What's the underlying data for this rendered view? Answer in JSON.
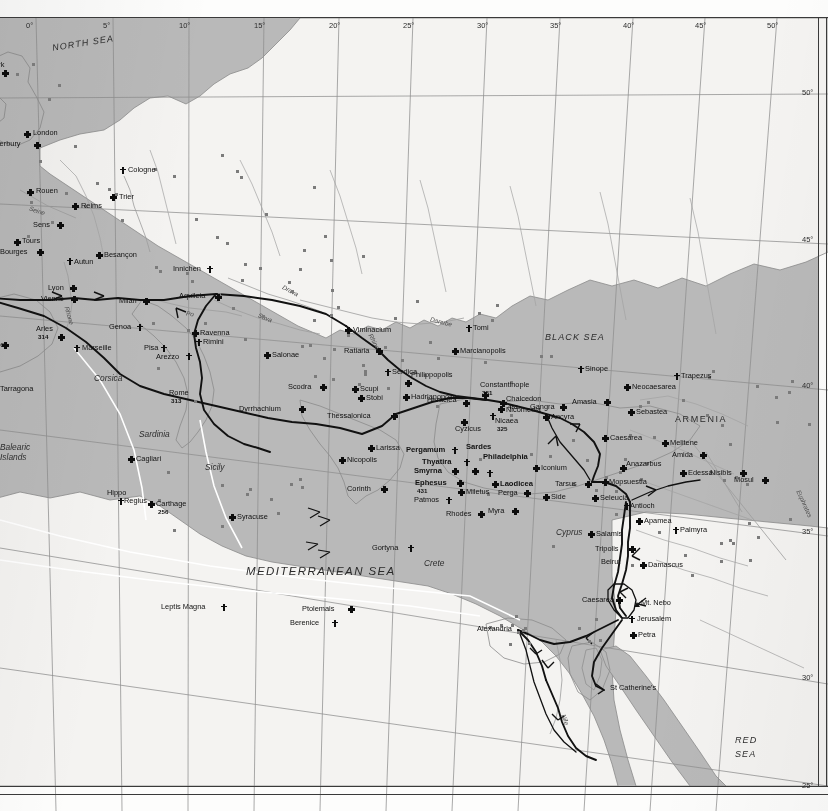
{
  "map": {
    "title": "Christian Centres and Pilgrim Routes of the Late Roman and Early Byzantine World",
    "projection_note": "conic graticule, 5-degree interval",
    "colors": {
      "sea": "#b9b9b9",
      "land": "#f4f3f1",
      "land_shaded": "#e7e6e3",
      "route": "#111111",
      "sea_route": "#ffffff",
      "graticule": "#8e8e8e",
      "text": "#111111"
    }
  },
  "graticule": {
    "longitude_labels": [
      "0°",
      "5°",
      "10°",
      "15°",
      "20°",
      "25°",
      "30°",
      "35°",
      "40°",
      "45°",
      "50°"
    ],
    "latitude_labels": [
      "50°",
      "45°",
      "40°",
      "35°",
      "30°",
      "25°"
    ]
  },
  "seas": [
    {
      "name": "NORTH SEA",
      "x": 52,
      "y": 38,
      "rot": -9,
      "size": "sm"
    },
    {
      "name": "BLACK SEA",
      "x": 545,
      "y": 332,
      "rot": 0,
      "size": "sm"
    },
    {
      "name": "MEDITERRANEAN SEA",
      "x": 246,
      "y": 565,
      "rot": 0,
      "size": "lg"
    },
    {
      "name": "RED",
      "x": 735,
      "y": 735,
      "rot": 0,
      "size": "sm"
    },
    {
      "name": "SEA",
      "x": 735,
      "y": 749,
      "rot": 0,
      "size": "sm"
    }
  ],
  "regions": [
    {
      "name": "ARMENIA",
      "x": 675,
      "y": 414
    }
  ],
  "islands": [
    {
      "name": "Corsica",
      "x": 94,
      "y": 373
    },
    {
      "name": "Sardinia",
      "x": 139,
      "y": 429
    },
    {
      "name": "Sicily",
      "x": 205,
      "y": 462
    },
    {
      "name": "Balearic",
      "x": 0,
      "y": 442
    },
    {
      "name": "Islands",
      "x": 0,
      "y": 452
    },
    {
      "name": "Crete",
      "x": 424,
      "y": 558
    },
    {
      "name": "Cyprus",
      "x": 556,
      "y": 527
    }
  ],
  "rivers": [
    {
      "name": "Rhine",
      "x": 366,
      "y": 338,
      "rot": 62
    },
    {
      "name": "Rhone",
      "x": 60,
      "y": 312,
      "rot": 74
    },
    {
      "name": "Seine",
      "x": 29,
      "y": 207,
      "rot": 18
    },
    {
      "name": "Danube",
      "x": 430,
      "y": 318,
      "rot": 14
    },
    {
      "name": "Drava",
      "x": 282,
      "y": 287,
      "rot": 28
    },
    {
      "name": "Sava",
      "x": 258,
      "y": 314,
      "rot": 22
    },
    {
      "name": "Po",
      "x": 186,
      "y": 310,
      "rot": 8
    },
    {
      "name": "Nile",
      "x": 560,
      "y": 716,
      "rot": 70
    },
    {
      "name": "Euphrates",
      "x": 790,
      "y": 500,
      "rot": 66
    }
  ],
  "places": [
    {
      "name": "York",
      "x": 2,
      "y": 70,
      "marker": "xcross",
      "lx": -12,
      "ly": -9,
      "anchor": "right"
    },
    {
      "name": "London",
      "x": 24,
      "y": 131,
      "marker": "xcross",
      "lx": 9,
      "ly": -2,
      "anchor": "left"
    },
    {
      "name": "Canterbury",
      "x": 34,
      "y": 142,
      "marker": "xcross",
      "lx": -50,
      "ly": -2,
      "anchor": "left"
    },
    {
      "name": "Cologne",
      "x": 120,
      "y": 167,
      "marker": "pcross",
      "lx": 8,
      "ly": -1,
      "anchor": "left"
    },
    {
      "name": "Rouen",
      "x": 27,
      "y": 189,
      "marker": "xcross",
      "lx": 9,
      "ly": -2,
      "anchor": "left"
    },
    {
      "name": "Trier",
      "x": 110,
      "y": 194,
      "marker": "xcross",
      "lx": 9,
      "ly": -1,
      "anchor": "left"
    },
    {
      "name": "Reims",
      "x": 72,
      "y": 203,
      "marker": "xcross",
      "lx": 9,
      "ly": -1,
      "anchor": "left"
    },
    {
      "name": "Sens",
      "x": 57,
      "y": 222,
      "marker": "xcross",
      "lx": -24,
      "ly": -1,
      "anchor": "left"
    },
    {
      "name": "Tours",
      "x": 14,
      "y": 239,
      "marker": "xcross",
      "lx": 8,
      "ly": -2,
      "anchor": "left"
    },
    {
      "name": "Bourges",
      "x": 37,
      "y": 249,
      "marker": "xcross",
      "lx": -37,
      "ly": -1,
      "anchor": "left"
    },
    {
      "name": "Autun",
      "x": 67,
      "y": 258,
      "marker": "pcross",
      "lx": 7,
      "ly": 0,
      "anchor": "left"
    },
    {
      "name": "Besançon",
      "x": 96,
      "y": 252,
      "marker": "xcross",
      "lx": 8,
      "ly": -1,
      "anchor": "left"
    },
    {
      "name": "Innichen",
      "x": 207,
      "y": 266,
      "marker": "pcross",
      "lx": -34,
      "ly": -1,
      "anchor": "left"
    },
    {
      "name": "Lyon",
      "x": 70,
      "y": 285,
      "marker": "xcross",
      "lx": -22,
      "ly": -1,
      "anchor": "left"
    },
    {
      "name": "Vienne",
      "x": 71,
      "y": 296,
      "marker": "xcross",
      "lx": -30,
      "ly": -1,
      "anchor": "left"
    },
    {
      "name": "Milan",
      "x": 143,
      "y": 298,
      "marker": "xcross",
      "lx": -24,
      "ly": -1,
      "anchor": "left"
    },
    {
      "name": "Aquileia",
      "x": 215,
      "y": 294,
      "marker": "xcross",
      "lx": -36,
      "ly": -2,
      "anchor": "left"
    },
    {
      "name": "Genoa",
      "x": 137,
      "y": 324,
      "marker": "pcross",
      "lx": -28,
      "ly": -1,
      "anchor": "left"
    },
    {
      "name": "Ravenna",
      "x": 192,
      "y": 330,
      "marker": "xcross",
      "lx": 8,
      "ly": -1,
      "anchor": "left"
    },
    {
      "name": "Rimini",
      "x": 196,
      "y": 339,
      "marker": "pcross",
      "lx": 7,
      "ly": -1,
      "anchor": "left"
    },
    {
      "name": "Arles",
      "x": 58,
      "y": 334,
      "marker": "xcross",
      "lx": -22,
      "ly": -9,
      "anchor": "left",
      "date": "314"
    },
    {
      "name": "Narbonne",
      "x": 2,
      "y": 342,
      "marker": "xcross",
      "lx": -30,
      "ly": -1,
      "anchor": "left"
    },
    {
      "name": "Marseille",
      "x": 74,
      "y": 345,
      "marker": "pcross",
      "lx": 8,
      "ly": -1,
      "anchor": "left"
    },
    {
      "name": "Pisa",
      "x": 161,
      "y": 345,
      "marker": "pcross",
      "lx": -17,
      "ly": -1,
      "anchor": "left"
    },
    {
      "name": "Arezzo",
      "x": 186,
      "y": 353,
      "marker": "pcross",
      "lx": -30,
      "ly": 0,
      "anchor": "left"
    },
    {
      "name": "Salonae",
      "x": 264,
      "y": 352,
      "marker": "xcross",
      "lx": 8,
      "ly": -1,
      "anchor": "left"
    },
    {
      "name": "Tarragona",
      "x": 0,
      "y": 389,
      "marker": "none",
      "lx": 0,
      "ly": -4,
      "anchor": "left"
    },
    {
      "name": "Rome",
      "x": 192,
      "y": 398,
      "marker": "town",
      "lx": -23,
      "ly": -9,
      "anchor": "left",
      "date": "313"
    },
    {
      "name": "Dyrrhachium",
      "x": 299,
      "y": 406,
      "marker": "xcross",
      "lx": -60,
      "ly": -1,
      "anchor": "left"
    },
    {
      "name": "Scodra",
      "x": 320,
      "y": 384,
      "marker": "xcross",
      "lx": -32,
      "ly": -1,
      "anchor": "left"
    },
    {
      "name": "Stobi",
      "x": 358,
      "y": 395,
      "marker": "xcross",
      "lx": 8,
      "ly": -1,
      "anchor": "left"
    },
    {
      "name": "Scupi",
      "x": 352,
      "y": 386,
      "marker": "xcross",
      "lx": 8,
      "ly": -1,
      "anchor": "left"
    },
    {
      "name": "Viminacium",
      "x": 345,
      "y": 327,
      "marker": "xcross",
      "lx": 8,
      "ly": -1,
      "anchor": "left"
    },
    {
      "name": "Ratiaria",
      "x": 376,
      "y": 348,
      "marker": "xcross",
      "lx": -32,
      "ly": -1,
      "anchor": "left"
    },
    {
      "name": "Serdica",
      "x": 385,
      "y": 369,
      "marker": "pcross",
      "lx": 7,
      "ly": -1,
      "anchor": "left"
    },
    {
      "name": "Philippopolis",
      "x": 405,
      "y": 380,
      "marker": "xcross",
      "lx": 6,
      "ly": -9,
      "anchor": "left"
    },
    {
      "name": "Hadrianopolis",
      "x": 403,
      "y": 394,
      "marker": "xcross",
      "lx": 8,
      "ly": -1,
      "anchor": "left"
    },
    {
      "name": "Tomi",
      "x": 466,
      "y": 325,
      "marker": "pcross",
      "lx": 7,
      "ly": -1,
      "anchor": "left"
    },
    {
      "name": "Marcianopolis",
      "x": 452,
      "y": 348,
      "marker": "xcross",
      "lx": 8,
      "ly": -1,
      "anchor": "left"
    },
    {
      "name": "Heraclea",
      "x": 463,
      "y": 400,
      "marker": "xcross",
      "lx": -36,
      "ly": -4,
      "anchor": "left"
    },
    {
      "name": "Constantinople",
      "x": 482,
      "y": 392,
      "marker": "xcross",
      "lx": -2,
      "ly": -11,
      "anchor": "left",
      "date": "381"
    },
    {
      "name": "Chalcedon",
      "x": 500,
      "y": 400,
      "marker": "xcross",
      "lx": 6,
      "ly": -5,
      "anchor": "left",
      "date": "451"
    },
    {
      "name": "Nicomedia",
      "x": 498,
      "y": 406,
      "marker": "xcross",
      "lx": 8,
      "ly": 0,
      "anchor": "left"
    },
    {
      "name": "Nicaea",
      "x": 490,
      "y": 413,
      "marker": "pcross",
      "lx": 5,
      "ly": 4,
      "anchor": "left",
      "date": "325"
    },
    {
      "name": "Gangra",
      "x": 560,
      "y": 404,
      "marker": "xcross",
      "lx": -30,
      "ly": -1,
      "anchor": "left"
    },
    {
      "name": "Ancyra",
      "x": 543,
      "y": 414,
      "marker": "xcross",
      "lx": 8,
      "ly": -1,
      "anchor": "left"
    },
    {
      "name": "Thessalonica",
      "x": 391,
      "y": 413,
      "marker": "xcross",
      "lx": -64,
      "ly": -1,
      "anchor": "left"
    },
    {
      "name": "Cyzicus",
      "x": 461,
      "y": 419,
      "marker": "xcross",
      "lx": -6,
      "ly": 6,
      "anchor": "left"
    },
    {
      "name": "Larissa",
      "x": 368,
      "y": 445,
      "marker": "xcross",
      "lx": 8,
      "ly": -1,
      "anchor": "left"
    },
    {
      "name": "Nicopolis",
      "x": 339,
      "y": 457,
      "marker": "xcross",
      "lx": 8,
      "ly": -1,
      "anchor": "left"
    },
    {
      "name": "Corinth",
      "x": 381,
      "y": 486,
      "marker": "xcross",
      "lx": -34,
      "ly": -1,
      "anchor": "left"
    },
    {
      "name": "Pergamum",
      "x": 452,
      "y": 447,
      "marker": "pcross",
      "lx": -46,
      "ly": -1,
      "anchor": "left",
      "bold": true
    },
    {
      "name": "Thyatira",
      "x": 464,
      "y": 459,
      "marker": "pcross",
      "lx": -42,
      "ly": -1,
      "anchor": "left",
      "bold": true
    },
    {
      "name": "Sardes",
      "x": 472,
      "y": 468,
      "marker": "xcross",
      "lx": -6,
      "ly": -25,
      "anchor": "left",
      "bold": true
    },
    {
      "name": "Smyrna",
      "x": 452,
      "y": 468,
      "marker": "xcross",
      "lx": -38,
      "ly": -1,
      "anchor": "left",
      "bold": true
    },
    {
      "name": "Philadelphia",
      "x": 487,
      "y": 470,
      "marker": "pcross",
      "lx": -4,
      "ly": -17,
      "anchor": "left",
      "bold": true
    },
    {
      "name": "Ephesus",
      "x": 457,
      "y": 480,
      "marker": "xcross",
      "lx": -42,
      "ly": -1,
      "anchor": "left",
      "bold": true,
      "date": "431"
    },
    {
      "name": "Laodicea",
      "x": 492,
      "y": 481,
      "marker": "xcross",
      "lx": 8,
      "ly": -1,
      "anchor": "left",
      "bold": true
    },
    {
      "name": "Miletus",
      "x": 458,
      "y": 489,
      "marker": "xcross",
      "lx": 8,
      "ly": -1,
      "anchor": "left"
    },
    {
      "name": "Patmos",
      "x": 446,
      "y": 497,
      "marker": "pcross",
      "lx": -32,
      "ly": -1,
      "anchor": "left"
    },
    {
      "name": "Rhodes",
      "x": 478,
      "y": 511,
      "marker": "xcross",
      "lx": -32,
      "ly": -1,
      "anchor": "left"
    },
    {
      "name": "Myra",
      "x": 512,
      "y": 508,
      "marker": "xcross",
      "lx": -24,
      "ly": -1,
      "anchor": "left"
    },
    {
      "name": "Perga",
      "x": 524,
      "y": 490,
      "marker": "xcross",
      "lx": -26,
      "ly": -1,
      "anchor": "left"
    },
    {
      "name": "Side",
      "x": 543,
      "y": 494,
      "marker": "xcross",
      "lx": 8,
      "ly": -1,
      "anchor": "left"
    },
    {
      "name": "Iconium",
      "x": 533,
      "y": 465,
      "marker": "xcross",
      "lx": 8,
      "ly": -1,
      "anchor": "left"
    },
    {
      "name": "Tarsus",
      "x": 585,
      "y": 481,
      "marker": "xcross",
      "lx": -30,
      "ly": -1,
      "anchor": "left"
    },
    {
      "name": "Seleucia",
      "x": 592,
      "y": 495,
      "marker": "xcross",
      "lx": 8,
      "ly": -1,
      "anchor": "left"
    },
    {
      "name": "Mopsuestia",
      "x": 602,
      "y": 479,
      "marker": "xcross",
      "lx": 7,
      "ly": -1,
      "anchor": "left"
    },
    {
      "name": "Anazarbus",
      "x": 620,
      "y": 465,
      "marker": "xcross",
      "lx": 6,
      "ly": -5,
      "anchor": "left"
    },
    {
      "name": "Caesarea",
      "x": 602,
      "y": 435,
      "marker": "xcross",
      "lx": 8,
      "ly": -1,
      "anchor": "left"
    },
    {
      "name": "Sinope",
      "x": 578,
      "y": 366,
      "marker": "pcross",
      "lx": 7,
      "ly": -1,
      "anchor": "left"
    },
    {
      "name": "Amasia",
      "x": 604,
      "y": 399,
      "marker": "xcross",
      "lx": -32,
      "ly": -1,
      "anchor": "left"
    },
    {
      "name": "Neocaesarea",
      "x": 624,
      "y": 384,
      "marker": "xcross",
      "lx": 8,
      "ly": -1,
      "anchor": "left"
    },
    {
      "name": "Trapezus",
      "x": 674,
      "y": 373,
      "marker": "pcross",
      "lx": 7,
      "ly": -1,
      "anchor": "left"
    },
    {
      "name": "Sebastea",
      "x": 628,
      "y": 409,
      "marker": "xcross",
      "lx": 8,
      "ly": -1,
      "anchor": "left"
    },
    {
      "name": "Melitene",
      "x": 662,
      "y": 440,
      "marker": "xcross",
      "lx": 8,
      "ly": -1,
      "anchor": "left"
    },
    {
      "name": "Amida",
      "x": 700,
      "y": 452,
      "marker": "xcross",
      "lx": -28,
      "ly": -1,
      "anchor": "left"
    },
    {
      "name": "Edessa",
      "x": 680,
      "y": 470,
      "marker": "xcross",
      "lx": 8,
      "ly": -1,
      "anchor": "left"
    },
    {
      "name": "Nisibis",
      "x": 740,
      "y": 470,
      "marker": "xcross",
      "lx": -30,
      "ly": -1,
      "anchor": "left"
    },
    {
      "name": "Mosul",
      "x": 762,
      "y": 477,
      "marker": "xcross",
      "lx": -28,
      "ly": -1,
      "anchor": "left"
    },
    {
      "name": "Antioch",
      "x": 624,
      "y": 503,
      "marker": "pcross",
      "lx": 6,
      "ly": -1,
      "anchor": "left"
    },
    {
      "name": "Apamea",
      "x": 636,
      "y": 518,
      "marker": "xcross",
      "lx": 8,
      "ly": -1,
      "anchor": "left"
    },
    {
      "name": "Palmyra",
      "x": 673,
      "y": 527,
      "marker": "pcross",
      "lx": 7,
      "ly": -1,
      "anchor": "left"
    },
    {
      "name": "Salamis",
      "x": 588,
      "y": 531,
      "marker": "xcross",
      "lx": 8,
      "ly": -1,
      "anchor": "left"
    },
    {
      "name": "Tripolis",
      "x": 629,
      "y": 546,
      "marker": "xcross",
      "lx": -34,
      "ly": -1,
      "anchor": "left"
    },
    {
      "name": "Beirut",
      "x": 629,
      "y": 562,
      "marker": "town",
      "lx": -28,
      "ly": -4,
      "anchor": "left"
    },
    {
      "name": "Damascus",
      "x": 640,
      "y": 562,
      "marker": "xcross",
      "lx": 8,
      "ly": -1,
      "anchor": "left"
    },
    {
      "name": "Caesarea",
      "x": 616,
      "y": 597,
      "marker": "xcross",
      "lx": -34,
      "ly": -1,
      "anchor": "left"
    },
    {
      "name": "Mt. Nebo",
      "x": 634,
      "y": 601,
      "marker": "mtn",
      "lx": 7,
      "ly": -2,
      "anchor": "left"
    },
    {
      "name": "Jerusalem",
      "x": 629,
      "y": 616,
      "marker": "pcross",
      "lx": 8,
      "ly": -1,
      "anchor": "left"
    },
    {
      "name": "Petra",
      "x": 630,
      "y": 632,
      "marker": "xcross",
      "lx": 8,
      "ly": -1,
      "anchor": "left"
    },
    {
      "name": "St Catherine's",
      "x": 607,
      "y": 688,
      "marker": "none",
      "lx": 3,
      "ly": -4,
      "anchor": "left"
    },
    {
      "name": "Alexandria",
      "x": 515,
      "y": 629,
      "marker": "town",
      "lx": -38,
      "ly": -4,
      "anchor": "left"
    },
    {
      "name": "Cagliari",
      "x": 128,
      "y": 456,
      "marker": "xcross",
      "lx": 8,
      "ly": -1,
      "anchor": "left"
    },
    {
      "name": "Syracuse",
      "x": 229,
      "y": 514,
      "marker": "xcross",
      "lx": 8,
      "ly": -1,
      "anchor": "left"
    },
    {
      "name": "Hippo",
      "x": 118,
      "y": 498,
      "marker": "pcross",
      "lx": -11,
      "ly": -9,
      "anchor": "left"
    },
    {
      "name": "Regius",
      "x": 118,
      "y": 498,
      "marker": "none",
      "lx": 6,
      "ly": -1,
      "anchor": "left"
    },
    {
      "name": "Carthage",
      "x": 148,
      "y": 501,
      "marker": "xcross",
      "lx": 8,
      "ly": -1,
      "anchor": "left",
      "date": "256"
    },
    {
      "name": "Leptis Magna",
      "x": 221,
      "y": 604,
      "marker": "pcross",
      "lx": -60,
      "ly": -1,
      "anchor": "left"
    },
    {
      "name": "Ptolemais",
      "x": 348,
      "y": 606,
      "marker": "xcross",
      "lx": -46,
      "ly": -1,
      "anchor": "left"
    },
    {
      "name": "Berenice",
      "x": 332,
      "y": 620,
      "marker": "pcross",
      "lx": -42,
      "ly": -1,
      "anchor": "left"
    },
    {
      "name": "Gortyna",
      "x": 408,
      "y": 545,
      "marker": "pcross",
      "lx": -36,
      "ly": -1,
      "anchor": "left"
    }
  ]
}
